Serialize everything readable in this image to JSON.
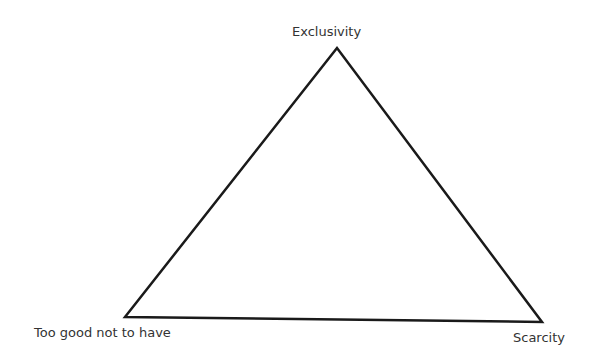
{
  "diagram": {
    "type": "triangle",
    "vertices": {
      "top": {
        "label": "Exclusivity"
      },
      "bottom_left": {
        "label": "Too good not to have"
      },
      "bottom_right": {
        "label": "Scarcity"
      }
    },
    "colors": {
      "line": "#1a1a1a",
      "text": "#333333",
      "background": "#ffffff"
    }
  }
}
